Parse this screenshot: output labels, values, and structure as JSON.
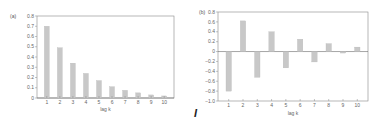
{
  "chart_data": [
    {
      "type": "bar",
      "panel_label": "(a)",
      "title": "",
      "xlabel": "lag k",
      "ylabel": "",
      "categories": [
        "1",
        "2",
        "3",
        "4",
        "5",
        "6",
        "7",
        "8",
        "9",
        "10"
      ],
      "values": [
        0.7,
        0.49,
        0.34,
        0.24,
        0.17,
        0.11,
        0.075,
        0.05,
        0.03,
        0.02
      ],
      "ylim": [
        0,
        0.8
      ],
      "yticks": [
        "0",
        "0.1",
        "0.2",
        "0.3",
        "0.4",
        "0.5",
        "0.6",
        "0.7",
        "0.8"
      ],
      "grid": false,
      "legend": null,
      "bar_color": "#c8c8c8"
    },
    {
      "type": "bar",
      "panel_label": "(b)",
      "title": "",
      "xlabel": "lag k",
      "ylabel": "",
      "categories": [
        "1",
        "2",
        "3",
        "4",
        "5",
        "6",
        "7",
        "8",
        "9",
        "10"
      ],
      "values": [
        -0.8,
        0.62,
        -0.52,
        0.4,
        -0.33,
        0.25,
        -0.21,
        0.16,
        -0.03,
        0.09
      ],
      "ylim": [
        -1.0,
        0.8
      ],
      "yticks": [
        "-1.0",
        "-0.8",
        "-0.6",
        "-0.4",
        "-0.2",
        "0",
        "0.2",
        "0.4",
        "0.6",
        "0.8"
      ],
      "grid": false,
      "legend": null,
      "bar_color": "#c8c8c8"
    }
  ],
  "annotations": {
    "cursor_mark": "I"
  },
  "colors": {
    "axis": "#888888",
    "bar": "#c8c8c8",
    "text": "#666666"
  }
}
